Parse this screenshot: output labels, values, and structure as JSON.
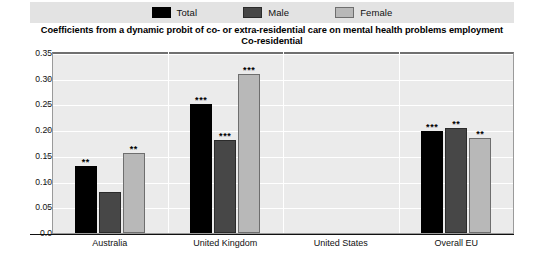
{
  "legend": {
    "items": [
      {
        "label": "Total",
        "color": "#000000",
        "icon": "legend-swatch-total"
      },
      {
        "label": "Male",
        "color": "#474747",
        "icon": "legend-swatch-male"
      },
      {
        "label": "Female",
        "color": "#b8b8b8",
        "icon": "legend-swatch-female"
      }
    ]
  },
  "title": {
    "line1": "Coefficients from a dynamic probit of co- or extra-residential care on mental health problems employment",
    "line2": "Co-residential"
  },
  "chart_data": {
    "type": "bar",
    "title": "Coefficients from a dynamic probit of co- or extra-residential care on mental health problems employment Co-residential",
    "subtitle": "Co-residential",
    "xlabel": "",
    "ylabel": "",
    "ylim": [
      0.0,
      0.35
    ],
    "yticks": [
      "0.0",
      "0.05",
      "0.10",
      "0.15",
      "0.20",
      "0.25",
      "0.30",
      "0.35"
    ],
    "ytick_values": [
      0.0,
      0.05,
      0.1,
      0.15,
      0.2,
      0.25,
      0.3,
      0.35
    ],
    "grid": true,
    "legend_position": "top",
    "categories": [
      "Australia",
      "United Kingdom",
      "United States",
      "Overall EU"
    ],
    "series": [
      {
        "name": "Total",
        "color": "#000000",
        "values": [
          0.13,
          0.25,
          null,
          0.198
        ],
        "significance": [
          "**",
          "***",
          "",
          "***"
        ]
      },
      {
        "name": "Male",
        "color": "#474747",
        "values": [
          0.08,
          0.18,
          null,
          0.205
        ],
        "significance": [
          "",
          "***",
          "",
          "**"
        ]
      },
      {
        "name": "Female",
        "color": "#b8b8b8",
        "values": [
          0.155,
          0.31,
          null,
          0.185
        ],
        "significance": [
          "**",
          "***",
          "",
          "**"
        ]
      }
    ]
  }
}
